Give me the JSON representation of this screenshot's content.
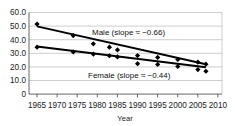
{
  "chart_data": {
    "type": "scatter",
    "title": "",
    "xlabel": "Year",
    "ylabel": "",
    "xlim": [
      1963,
      2011
    ],
    "ylim": [
      0,
      60
    ],
    "grid": true,
    "legend_position": "inline-annotation",
    "xticks": [
      "1965",
      "1970",
      "1975",
      "1980",
      "1985",
      "1990",
      "1995",
      "2000",
      "2005",
      "2010"
    ],
    "xtick_values": [
      1965,
      1970,
      1975,
      1980,
      1985,
      1990,
      1995,
      2000,
      2005,
      2010
    ],
    "yticks": [
      "0",
      "10.0",
      "20.0",
      "30.0",
      "40.0",
      "50.0",
      "60.0"
    ],
    "ytick_values": [
      0,
      10,
      20,
      30,
      40,
      50,
      60
    ],
    "series": [
      {
        "name": "Male",
        "annotation": "Male (slope ≈ −0.66)",
        "slope": -0.66,
        "marker": "diamond",
        "x": [
          1965,
          1974,
          1979,
          1983,
          1985,
          1990,
          1995,
          2000,
          2005,
          2007
        ],
        "y": [
          51.5,
          43.0,
          37.0,
          34.5,
          32.5,
          28.3,
          27.0,
          25.5,
          23.5,
          22.0
        ],
        "trend_x": [
          1965,
          2007
        ],
        "trend_y": [
          49.8,
          22.0
        ]
      },
      {
        "name": "Female",
        "annotation": "Female (slope ≈ −0.44)",
        "slope": -0.44,
        "marker": "diamond",
        "x": [
          1965,
          1974,
          1979,
          1983,
          1985,
          1990,
          1995,
          2000,
          2005,
          2007
        ],
        "y": [
          34.5,
          31.0,
          29.4,
          28.2,
          27.3,
          22.4,
          21.8,
          20.3,
          18.0,
          16.8
        ],
        "trend_x": [
          1965,
          2007
        ],
        "trend_y": [
          35.0,
          19.8
        ]
      }
    ]
  },
  "axis": {
    "x_title": "Year"
  }
}
